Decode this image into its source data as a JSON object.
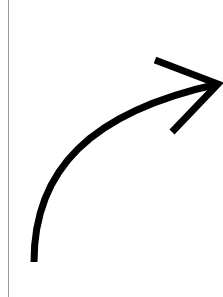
{
  "image": {
    "subject": "curved-arrow",
    "description": "Black curved arrow sweeping upward and to the right",
    "colors": {
      "background": "#ffffff",
      "arrow": "#000000",
      "edge_line": "#9a9a9a"
    },
    "icon": "curved-arrow-up-right-icon"
  }
}
